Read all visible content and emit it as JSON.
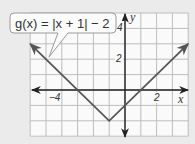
{
  "chart_data": {
    "type": "line",
    "title": "",
    "function_label": "g(x) = |x + 1| − 2",
    "xlabel": "x",
    "ylabel": "y",
    "xlim": [
      -6,
      4
    ],
    "ylim": [
      -3,
      5
    ],
    "grid": true,
    "x_tick_labels": [
      {
        "value": -4,
        "label": "−4"
      },
      {
        "value": 2,
        "label": "2"
      }
    ],
    "y_tick_labels": [
      {
        "value": 4,
        "label": "4"
      },
      {
        "value": 2,
        "label": "2"
      }
    ],
    "series": [
      {
        "name": "g(x) = |x + 1| − 2",
        "x": [
          -6,
          -1,
          4
        ],
        "y": [
          3,
          -2,
          3
        ],
        "arrows_both_ends": true
      }
    ],
    "vertex": {
      "x": -1,
      "y": -2
    }
  },
  "colors": {
    "background": "#ebebeb",
    "grid_bg": "#fafafa",
    "grid_line": "#bdbdbd",
    "axis": "#222222",
    "graph_line": "#555555",
    "callout_border": "#9a9a9a"
  }
}
